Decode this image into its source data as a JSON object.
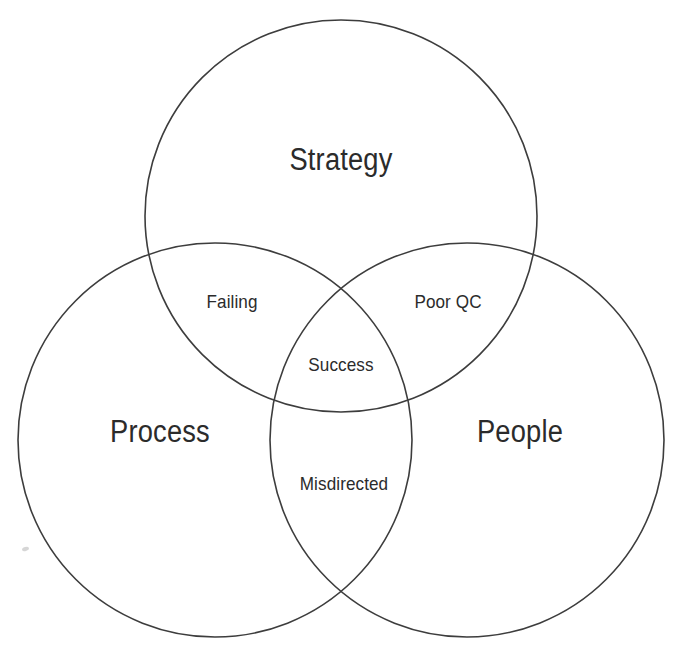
{
  "diagram": {
    "type": "venn",
    "set_count": 3,
    "background_color": "#ffffff",
    "stroke_color": "#3d3d3d",
    "text_color": "#2b2b2b",
    "sets": [
      {
        "id": "strategy",
        "label": "Strategy",
        "cx": 341,
        "cy": 216,
        "r": 196,
        "label_x": 341,
        "label_y": 160
      },
      {
        "id": "process",
        "label": "Process",
        "cx": 215,
        "cy": 440,
        "r": 197,
        "label_x": 160,
        "label_y": 432
      },
      {
        "id": "people",
        "label": "People",
        "cx": 467,
        "cy": 440,
        "r": 197,
        "label_x": 520,
        "label_y": 432
      }
    ],
    "intersections": [
      {
        "id": "strategy-process",
        "label": "Failing",
        "sets": [
          "strategy",
          "process"
        ],
        "label_x": 232,
        "label_y": 302
      },
      {
        "id": "strategy-people",
        "label": "Poor QC",
        "sets": [
          "strategy",
          "people"
        ],
        "label_x": 448,
        "label_y": 302
      },
      {
        "id": "strategy-process-people",
        "label": "Success",
        "sets": [
          "strategy",
          "process",
          "people"
        ],
        "label_x": 341,
        "label_y": 365
      },
      {
        "id": "process-people",
        "label": "Misdirected",
        "sets": [
          "process",
          "people"
        ],
        "label_x": 344,
        "label_y": 484
      }
    ],
    "artifacts": [
      {
        "id": "scan-speck",
        "x": 22,
        "y": 547
      }
    ]
  }
}
